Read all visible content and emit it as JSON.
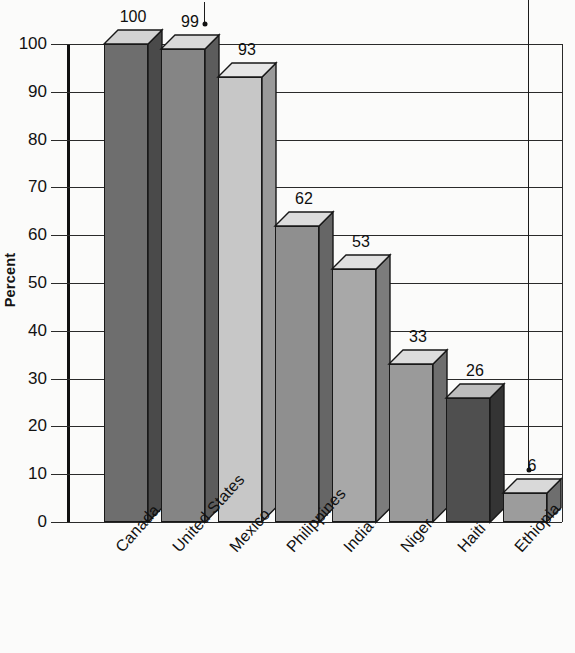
{
  "chart_data": {
    "type": "bar",
    "title": "",
    "subtitle": "",
    "xlabel": "",
    "ylabel": "Percent",
    "ylim": [
      0,
      100
    ],
    "ytick_step": 10,
    "grid": true,
    "legend": "none",
    "style": "3d-bars-grayscale",
    "categories": [
      "Canada",
      "United States",
      "Mexico",
      "Philippines",
      "India",
      "Niger",
      "Haiti",
      "Ethiopia"
    ],
    "values": [
      100,
      99,
      93,
      62,
      53,
      33,
      26,
      6
    ],
    "value_labels": [
      "100",
      "99",
      "93",
      "62",
      "53",
      "33",
      "26",
      "6"
    ],
    "ytick_labels": [
      "0",
      "10",
      "20",
      "30",
      "40",
      "50",
      "60",
      "70",
      "80",
      "90",
      "100"
    ],
    "bar_colors": [
      "#6e6e6e",
      "#858585",
      "#c7c7c7",
      "#8f8f8f",
      "#a8a8a8",
      "#9a9a9a",
      "#4f4f4f",
      "#9c9c9c"
    ],
    "bar_side_colors": [
      "#4a4a4a",
      "#5c5c5c",
      "#9a9a9a",
      "#666666",
      "#7c7c7c",
      "#6e6e6e",
      "#343434",
      "#6e6e6e"
    ],
    "bar_top_colors": [
      "#d3d3d3",
      "#d9d9d9",
      "#e6e6e6",
      "#dcdcdc",
      "#e0e0e0",
      "#dcdcdc",
      "#bdbdbd",
      "#d9d9d9"
    ],
    "annotations": [
      {
        "name": "pointer-to-united-states",
        "target": "99",
        "style": "down-arrow"
      },
      {
        "name": "pointer-to-ethiopia",
        "target": "6",
        "style": "down-arrow"
      }
    ],
    "axis_color": "#2a2a2a",
    "text_color": "#111111"
  }
}
